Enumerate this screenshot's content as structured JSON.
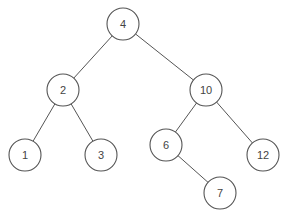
{
  "diagram": {
    "type": "binary-search-tree",
    "radius": 16,
    "colors": {
      "stroke": "#555555",
      "text": "#444444",
      "fill": "#ffffff"
    },
    "nodes": [
      {
        "id": "n4",
        "label": "4",
        "x": 123,
        "y": 24
      },
      {
        "id": "n2",
        "label": "2",
        "x": 63,
        "y": 90
      },
      {
        "id": "n10",
        "label": "10",
        "x": 206,
        "y": 90
      },
      {
        "id": "n1",
        "label": "1",
        "x": 25,
        "y": 155
      },
      {
        "id": "n3",
        "label": "3",
        "x": 101,
        "y": 155
      },
      {
        "id": "n6",
        "label": "6",
        "x": 166,
        "y": 145
      },
      {
        "id": "n12",
        "label": "12",
        "x": 263,
        "y": 155
      },
      {
        "id": "n7",
        "label": "7",
        "x": 220,
        "y": 193
      }
    ],
    "edges": [
      {
        "from": "n4",
        "to": "n2"
      },
      {
        "from": "n4",
        "to": "n10"
      },
      {
        "from": "n2",
        "to": "n1"
      },
      {
        "from": "n2",
        "to": "n3"
      },
      {
        "from": "n10",
        "to": "n6"
      },
      {
        "from": "n10",
        "to": "n12"
      },
      {
        "from": "n6",
        "to": "n7"
      }
    ]
  }
}
